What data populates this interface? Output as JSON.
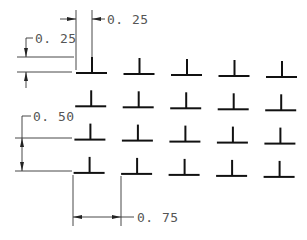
{
  "drawing": {
    "type": "array-spacing-dimension-drawing",
    "grid": {
      "rows": 4,
      "columns": 5,
      "symbol": "inverted-T",
      "origin_px": [
        76,
        73
      ],
      "col_pitch_px": 47.5,
      "row_pitch_px": 33.3,
      "row_slope_px_per_col": 1,
      "symbol_width_px": 31,
      "symbol_height_px": 16,
      "symbol_stem_offset_px": 16
    },
    "dimensions": [
      {
        "id": "stem-offset-horizontal",
        "label": "0. 25",
        "orientation": "horizontal",
        "position": "top"
      },
      {
        "id": "stem-height-vertical",
        "label": "0. 25",
        "orientation": "vertical",
        "position": "left-top"
      },
      {
        "id": "row-spacing",
        "label": "0. 50",
        "orientation": "vertical",
        "position": "left"
      },
      {
        "id": "column-spacing",
        "label": "0. 75",
        "orientation": "horizontal",
        "position": "bottom"
      }
    ],
    "colors": {
      "symbol": "#111111",
      "dimension_line": "#333333",
      "dimension_text": "#555555",
      "background": "#ffffff"
    }
  }
}
